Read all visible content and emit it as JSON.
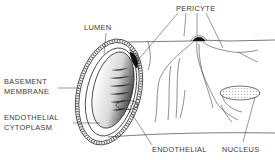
{
  "diagram": {
    "labels": {
      "lumen": "LUMEN",
      "pericyte": "PERICYTE",
      "basement_membrane_line1": "BASEMENT",
      "basement_membrane_line2": "MEMBRANE",
      "endothelial_cytoplasm_line1": "ENDOTHELIAL",
      "endothelial_cytoplasm_line2": "CYTOPLASM",
      "endothelial": "ENDOTHELIAL",
      "nucleus": "NUCLEUS"
    },
    "colors": {
      "ink": "#3a3a3a",
      "background": "#ffffff",
      "pericyte_body": "#111111"
    }
  }
}
